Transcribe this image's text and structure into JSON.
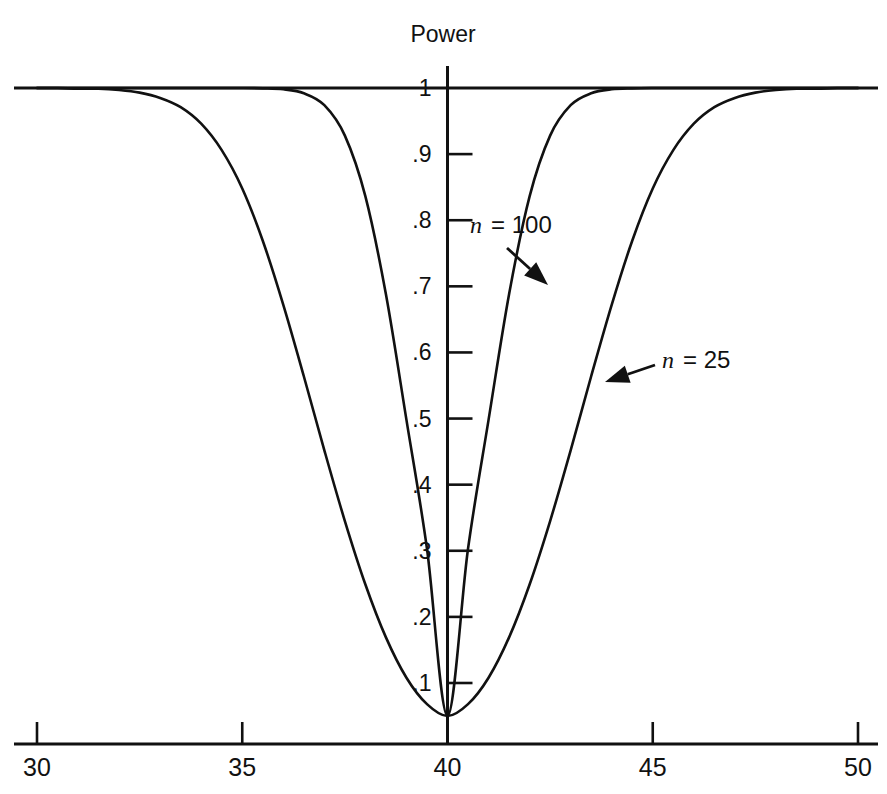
{
  "chart_data": {
    "type": "line",
    "title": "",
    "xlabel": "",
    "ylabel": "Power",
    "xlim": [
      30,
      50
    ],
    "ylim": [
      0,
      1
    ],
    "grid": false,
    "legend_position": "inline-annotations",
    "x_ticks": [
      30,
      35,
      40,
      45,
      50
    ],
    "x_tick_labels": [
      "30",
      "35",
      "40",
      "45",
      "50"
    ],
    "y_ticks": [
      1,
      0.9,
      0.8,
      0.7,
      0.6,
      0.5,
      0.4,
      0.3,
      0.2,
      0.1
    ],
    "y_tick_labels": [
      "1",
      ".9",
      ".8",
      ".7",
      ".6",
      ".5",
      ".4",
      ".3",
      ".2",
      ".1"
    ],
    "reference_line": {
      "y": 1,
      "label": "1",
      "from_x": 30,
      "to_x": 50
    },
    "null_value": 40,
    "minimum_power": 0.05,
    "series": [
      {
        "name": "n = 25",
        "n": 25,
        "annotation": "n = 25",
        "x": [
          30.0,
          30.5,
          31.0,
          31.5,
          32.0,
          32.5,
          33.0,
          33.5,
          34.0,
          34.5,
          35.0,
          35.5,
          36.0,
          36.5,
          37.0,
          37.5,
          38.0,
          38.5,
          39.0,
          39.5,
          40.0,
          40.5,
          41.0,
          41.5,
          42.0,
          42.5,
          43.0,
          43.5,
          44.0,
          44.5,
          45.0,
          45.5,
          46.0,
          46.5,
          47.0,
          47.5,
          48.0,
          48.5,
          49.0,
          49.5,
          50.0
        ],
        "y": [
          1.0,
          1.0,
          0.999,
          0.999,
          0.997,
          0.993,
          0.985,
          0.971,
          0.946,
          0.906,
          0.848,
          0.769,
          0.672,
          0.564,
          0.452,
          0.345,
          0.249,
          0.169,
          0.108,
          0.068,
          0.05,
          0.068,
          0.108,
          0.169,
          0.249,
          0.345,
          0.452,
          0.564,
          0.672,
          0.769,
          0.848,
          0.906,
          0.946,
          0.971,
          0.985,
          0.993,
          0.997,
          0.999,
          0.999,
          1.0,
          1.0
        ]
      },
      {
        "name": "n = 100",
        "n": 100,
        "annotation": "n = 100",
        "x": [
          30.0,
          30.5,
          31.0,
          31.5,
          32.0,
          32.5,
          33.0,
          33.5,
          34.0,
          34.5,
          35.0,
          35.5,
          36.0,
          36.5,
          37.0,
          37.5,
          38.0,
          38.5,
          39.0,
          39.5,
          40.0,
          40.5,
          41.0,
          41.5,
          42.0,
          42.5,
          43.0,
          43.5,
          44.0,
          44.5,
          45.0,
          45.5,
          46.0,
          46.5,
          47.0,
          47.5,
          48.0,
          48.5,
          49.0,
          49.5,
          50.0
        ],
        "y": [
          1.0,
          1.0,
          1.0,
          1.0,
          1.0,
          1.0,
          1.0,
          1.0,
          1.0,
          1.0,
          1.0,
          0.9995,
          0.998,
          0.992,
          0.974,
          0.928,
          0.836,
          0.688,
          0.498,
          0.303,
          0.05,
          0.303,
          0.498,
          0.688,
          0.836,
          0.928,
          0.974,
          0.992,
          0.998,
          0.9995,
          1.0,
          1.0,
          1.0,
          1.0,
          1.0,
          1.0,
          1.0,
          1.0,
          1.0,
          1.0,
          1.0
        ]
      }
    ]
  },
  "axis": {
    "y_title": "Power"
  },
  "annotations": [
    {
      "id": "n100",
      "n_symbol": "n",
      "rest": "=  100",
      "text_x": 470,
      "text_y": 233,
      "leader_from": [
        507,
        248
      ],
      "leader_to": [
        548,
        285
      ]
    },
    {
      "id": "n25",
      "n_symbol": "n",
      "rest": "=  25",
      "text_x": 662,
      "text_y": 368,
      "leader_from": [
        655,
        365
      ],
      "leader_to": [
        605,
        382
      ]
    }
  ],
  "colors": {
    "ink": "#111111",
    "background": "#ffffff"
  }
}
